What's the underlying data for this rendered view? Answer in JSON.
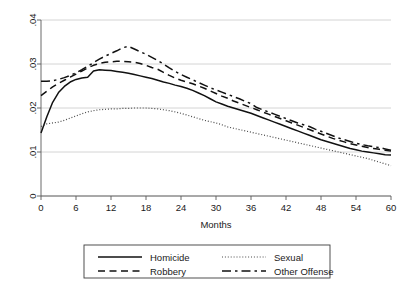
{
  "chart_data": {
    "type": "line",
    "title": "",
    "subtitle": "",
    "xlabel": "Months",
    "ylabel": "",
    "xlim": [
      0,
      60
    ],
    "ylim": [
      0,
      0.04
    ],
    "grid": true,
    "grid_axis": "y",
    "legend_position": "bottom",
    "x_ticks": [
      0,
      6,
      12,
      18,
      24,
      30,
      36,
      42,
      48,
      54,
      60
    ],
    "x_tick_labels": [
      "0",
      "6",
      "12",
      "18",
      "24",
      "30",
      "36",
      "42",
      "48",
      "54",
      "60"
    ],
    "y_ticks": [
      0,
      0.01,
      0.02,
      0.03,
      0.04
    ],
    "y_tick_labels": [
      "0",
      ".01",
      ".02",
      ".03",
      ".04"
    ],
    "x": [
      0,
      1,
      2,
      3,
      4,
      5,
      6,
      7,
      8,
      9,
      10,
      11,
      12,
      13,
      14,
      15,
      16,
      17,
      18,
      19,
      20,
      21,
      22,
      23,
      24,
      25,
      26,
      27,
      28,
      29,
      30,
      31,
      32,
      33,
      34,
      35,
      36,
      37,
      38,
      39,
      40,
      41,
      42,
      43,
      44,
      45,
      46,
      47,
      48,
      49,
      50,
      51,
      52,
      53,
      54,
      55,
      56,
      57,
      58,
      59,
      60
    ],
    "series": [
      {
        "name": "Homicide",
        "style": "solid",
        "values": [
          0.0143,
          0.018,
          0.0213,
          0.0235,
          0.0249,
          0.0259,
          0.0265,
          0.0268,
          0.027,
          0.0284,
          0.0287,
          0.0286,
          0.0285,
          0.0283,
          0.0281,
          0.0279,
          0.0276,
          0.0273,
          0.027,
          0.0267,
          0.0263,
          0.0259,
          0.0256,
          0.0252,
          0.0249,
          0.0245,
          0.024,
          0.0234,
          0.0228,
          0.0221,
          0.0214,
          0.0209,
          0.0204,
          0.02,
          0.0196,
          0.0192,
          0.0188,
          0.0183,
          0.0178,
          0.0173,
          0.0168,
          0.0163,
          0.0158,
          0.0153,
          0.0148,
          0.0143,
          0.0138,
          0.0133,
          0.0128,
          0.0124,
          0.012,
          0.0116,
          0.0112,
          0.0108,
          0.0105,
          0.0102,
          0.01,
          0.0098,
          0.0096,
          0.0094,
          0.0093
        ]
      },
      {
        "name": "Robbery",
        "style": "dashed",
        "values": [
          0.0228,
          0.0238,
          0.0248,
          0.0256,
          0.0263,
          0.027,
          0.0277,
          0.0284,
          0.0291,
          0.0297,
          0.0301,
          0.0304,
          0.0305,
          0.0306,
          0.0306,
          0.0305,
          0.0304,
          0.0301,
          0.0297,
          0.0292,
          0.0288,
          0.0281,
          0.0274,
          0.0268,
          0.0263,
          0.0259,
          0.0255,
          0.025,
          0.0245,
          0.0239,
          0.0233,
          0.0227,
          0.0222,
          0.0216,
          0.0211,
          0.0206,
          0.0201,
          0.0196,
          0.0191,
          0.0186,
          0.0181,
          0.0176,
          0.0171,
          0.0166,
          0.0161,
          0.0156,
          0.0151,
          0.0146,
          0.0141,
          0.0136,
          0.0131,
          0.0127,
          0.0123,
          0.0119,
          0.0116,
          0.0113,
          0.011,
          0.0108,
          0.0106,
          0.0104,
          0.0102
        ]
      },
      {
        "name": "Other Offense",
        "style": "dash-dot",
        "values": [
          0.0261,
          0.0261,
          0.0262,
          0.0265,
          0.0269,
          0.0274,
          0.028,
          0.0287,
          0.0295,
          0.0303,
          0.0311,
          0.0318,
          0.0324,
          0.033,
          0.0337,
          0.034,
          0.0334,
          0.0328,
          0.0322,
          0.0315,
          0.0308,
          0.03,
          0.0291,
          0.0283,
          0.0276,
          0.027,
          0.0264,
          0.0258,
          0.0252,
          0.0246,
          0.0241,
          0.0236,
          0.0231,
          0.0226,
          0.0221,
          0.0215,
          0.021,
          0.0201,
          0.0196,
          0.0191,
          0.0186,
          0.0181,
          0.0176,
          0.0171,
          0.0166,
          0.0162,
          0.0158,
          0.0152,
          0.0147,
          0.0142,
          0.0137,
          0.0132,
          0.0128,
          0.0124,
          0.012,
          0.0117,
          0.0114,
          0.0112,
          0.011,
          0.0107,
          0.0104
        ]
      },
      {
        "name": "Sexual",
        "style": "dotted",
        "values": [
          0.0158,
          0.0164,
          0.0166,
          0.0168,
          0.0172,
          0.0177,
          0.0182,
          0.0187,
          0.0191,
          0.0194,
          0.0196,
          0.0197,
          0.0198,
          0.0198,
          0.0199,
          0.0199,
          0.02,
          0.02,
          0.02,
          0.0199,
          0.0198,
          0.0196,
          0.0194,
          0.0191,
          0.0188,
          0.0184,
          0.018,
          0.0176,
          0.0172,
          0.0169,
          0.0166,
          0.0162,
          0.0157,
          0.0154,
          0.0151,
          0.0148,
          0.0145,
          0.0142,
          0.0139,
          0.0136,
          0.0133,
          0.013,
          0.0127,
          0.0124,
          0.0121,
          0.0118,
          0.0115,
          0.0112,
          0.0109,
          0.0106,
          0.0103,
          0.01,
          0.0097,
          0.0094,
          0.0091,
          0.0088,
          0.0085,
          0.0081,
          0.0077,
          0.0073,
          0.0069
        ]
      }
    ]
  },
  "legend": {
    "entries": [
      {
        "label": "Homicide",
        "style": "solid"
      },
      {
        "label": "Sexual",
        "style": "dotted"
      },
      {
        "label": "Robbery",
        "style": "dashed"
      },
      {
        "label": "Other Offense",
        "style": "dash-dot"
      }
    ]
  }
}
